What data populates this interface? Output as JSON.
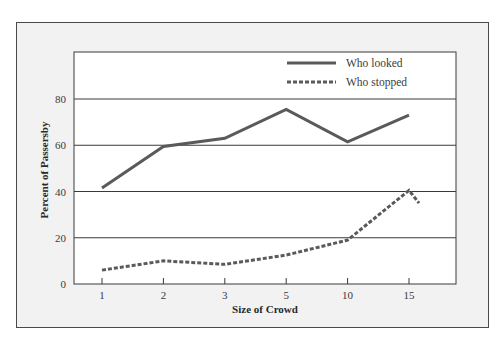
{
  "chart_data": {
    "type": "line",
    "title": "",
    "xlabel": "Size of Crowd",
    "ylabel": "Percent of Passersby",
    "categories": [
      "1",
      "2",
      "3",
      "5",
      "10",
      "15"
    ],
    "series": [
      {
        "name": "Who looked",
        "style": "solid",
        "values": [
          41.5,
          59.5,
          63,
          75.5,
          61.5,
          73
        ]
      },
      {
        "name": "Who stopped",
        "style": "dashed",
        "values": [
          6,
          10,
          8.5,
          12.5,
          19,
          40.5
        ],
        "tail_value": 35
      }
    ],
    "yticks": [
      0,
      20,
      40,
      60,
      80
    ],
    "ylim": [
      0,
      100
    ],
    "grid": {
      "horizontal": true,
      "vertical": false
    },
    "legend_position": "top-right-inside",
    "colors": {
      "line": "#5a5a5a",
      "grid": "#3a3a3a",
      "frame_bg": "#f2f2f2",
      "plot_bg": "#ffffff"
    }
  }
}
